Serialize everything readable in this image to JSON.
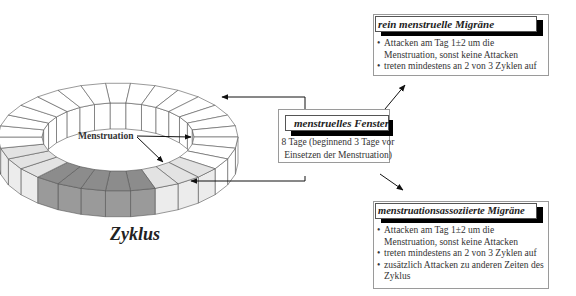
{
  "ring": {
    "segment_count": 30,
    "menstruation_segments": [
      14,
      15,
      16,
      17,
      18
    ],
    "window_light_segments": [
      11,
      12,
      13,
      19,
      20,
      21
    ],
    "colors": {
      "menstruation": "#8c8c8c",
      "window": "#e3e3e3",
      "outline": "#555555"
    },
    "label": "Menstruation",
    "caption": "Zyklus"
  },
  "center_box": {
    "title": "menstruelles Fenster",
    "line1": "8 Tage (beginnend 3 Tage vor",
    "line2": "Einsetzen der Menstruation)"
  },
  "top_box": {
    "title": "rein menstruelle Migräne",
    "bullets": [
      "Attacken am Tag 1±2 um die Menstruation, sonst keine Attacken",
      "treten mindestens an 2 von 3 Zyklen auf"
    ]
  },
  "bottom_box": {
    "title": "menstruationsassoziierte Migräne",
    "bullets": [
      "Attacken am Tag 1±2 um die Menstruation, sonst keine Attacken",
      "treten mindestens an 2 von 3 Zyklen auf",
      "zusätzlich Attacken zu anderen Zeiten des Zyklus"
    ]
  }
}
